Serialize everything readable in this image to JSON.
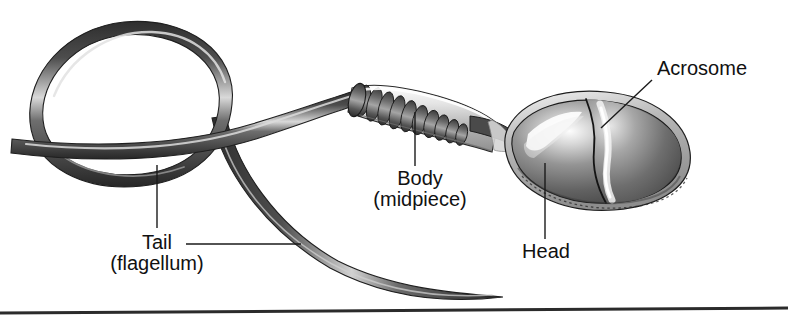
{
  "figure": {
    "background_color": "#ffffff",
    "ink_color": "#1a1a1a",
    "width": 788,
    "height": 326
  },
  "labels": {
    "acrosome": "Acrosome",
    "body_line1": "Body",
    "body_line2": "(midpiece)",
    "head": "Head",
    "tail_line1": "Tail",
    "tail_line2": "(flagellum)"
  },
  "parts": {
    "head_name": "head",
    "acrosome_name": "acrosome-cap",
    "midpiece_name": "midpiece-sheath",
    "mitochondria_name": "mitochondrial-coil",
    "neck_name": "neck",
    "tail_name": "flagellum",
    "tail_loop_name": "flagellum-loop",
    "baseline_name": "bottom-rule"
  },
  "colors": {
    "outline": "#1a1a1a",
    "tail_dark": "#3c3c3c",
    "tail_mid": "#5a5a5a",
    "tail_light": "#c8c8c8",
    "head_dark": "#4a4a4a",
    "head_mid": "#8a8a8a",
    "head_light": "#f2f2f2",
    "sheath_light": "#ededed",
    "rule": "#2b2b2b"
  }
}
